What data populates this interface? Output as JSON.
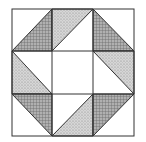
{
  "diagram": {
    "type": "quilt-block",
    "grid": {
      "rows": 3,
      "cols": 3
    },
    "colors": {
      "background": "#ffffff",
      "line": "#333333",
      "checkered": "#9a9a9a",
      "stippled": "#c4c4c4"
    },
    "cells": [
      {
        "row": 0,
        "col": 0,
        "shaded_triangle": "bottom-right",
        "pattern": "checkered"
      },
      {
        "row": 0,
        "col": 1,
        "shaded_triangle": "top-left",
        "pattern": "stippled"
      },
      {
        "row": 0,
        "col": 2,
        "shaded_triangle": "bottom-left",
        "pattern": "checkered"
      },
      {
        "row": 1,
        "col": 0,
        "shaded_triangle": "bottom-left",
        "pattern": "stippled"
      },
      {
        "row": 1,
        "col": 1,
        "shaded_triangle": "none",
        "pattern": "none"
      },
      {
        "row": 1,
        "col": 2,
        "shaded_triangle": "top-right",
        "pattern": "stippled"
      },
      {
        "row": 2,
        "col": 0,
        "shaded_triangle": "top-right",
        "pattern": "checkered"
      },
      {
        "row": 2,
        "col": 1,
        "shaded_triangle": "bottom-right",
        "pattern": "stippled"
      },
      {
        "row": 2,
        "col": 2,
        "shaded_triangle": "top-left",
        "pattern": "checkered"
      }
    ]
  }
}
